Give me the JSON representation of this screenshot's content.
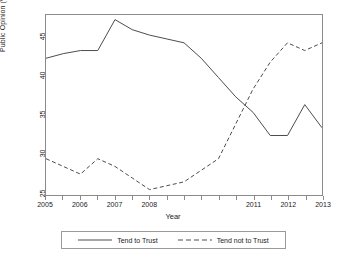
{
  "chart_data": {
    "type": "line",
    "title": "",
    "xlabel": "Year",
    "ylabel": "Public Opinion (%)",
    "xlim": [
      2005,
      2013
    ],
    "ylim": [
      24.3,
      47.6
    ],
    "grid": false,
    "legend_position": "bottom",
    "x": [
      2005,
      2005.5,
      2006,
      2006.5,
      2007,
      2007.5,
      2008,
      2008.5,
      2009,
      2009.5,
      2010,
      2010.5,
      2011,
      2011.5,
      2012,
      2012.5,
      2013
    ],
    "x_tick_values": [
      2005,
      2006,
      2007,
      2008,
      2011,
      2012,
      2013
    ],
    "x_tick_labels": [
      "2005",
      "2006",
      "2007",
      "2008",
      "2011",
      "2012",
      "2013"
    ],
    "y_tick_values": [
      25,
      30,
      35,
      40,
      45
    ],
    "y_tick_labels": [
      "25",
      "30",
      "35",
      "40",
      "45"
    ],
    "series": [
      {
        "name": "Tend to Trust",
        "style": "solid",
        "color": "#4d4d4d",
        "values": [
          42,
          42.6,
          43,
          43,
          47,
          45.7,
          45,
          44.5,
          44,
          42,
          39.5,
          37,
          35,
          32,
          32,
          36,
          33
        ]
      },
      {
        "name": "Tend not to Trust",
        "style": "dashed",
        "color": "#4d4d4d",
        "values": [
          29,
          28,
          27,
          29,
          28,
          26.5,
          25,
          25.5,
          26,
          27.5,
          29,
          33.5,
          38,
          41.5,
          44,
          43,
          44
        ]
      }
    ]
  },
  "axes": {
    "y_title": "Public Opinion (%)",
    "x_title": "Year"
  },
  "legend": {
    "items": [
      {
        "label": "Tend to Trust",
        "style": "solid"
      },
      {
        "label": "Tend not to Trust",
        "style": "dashed"
      }
    ]
  },
  "colors": {
    "line": "#4d4d4d",
    "frame": "#8a8a8a",
    "text": "#1a1a1a",
    "background": "#ffffff"
  }
}
